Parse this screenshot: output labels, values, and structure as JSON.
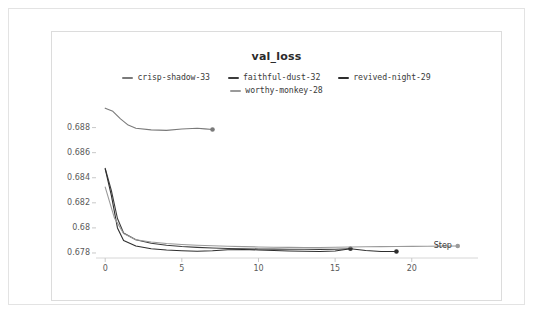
{
  "panel": {
    "background": "#ffffff",
    "border_color": "#e3e3e3"
  },
  "chart_data": {
    "type": "line",
    "title": "val_loss",
    "xlabel": "Step",
    "ylabel": "",
    "xlim": [
      -0.6,
      23.8
    ],
    "ylim": [
      0.6776,
      0.6902
    ],
    "xticks": [
      0,
      5,
      10,
      15,
      20
    ],
    "xtick_labels": [
      "0",
      "5",
      "10",
      "15",
      "20"
    ],
    "yticks": [
      0.678,
      0.68,
      0.682,
      0.684,
      0.686,
      0.688
    ],
    "ytick_labels": [
      "0.678",
      "0.68",
      "0.682",
      "0.684",
      "0.686",
      "0.688"
    ],
    "grid": false,
    "legend_position": "top-center",
    "end_marker": "dot",
    "series": [
      {
        "name": "crisp-shadow-33",
        "color": "#7a7a7a",
        "x": [
          0,
          0.5,
          1,
          1.5,
          2,
          3,
          4,
          5,
          6,
          6.5,
          7
        ],
        "y": [
          0.68955,
          0.6893,
          0.6887,
          0.6882,
          0.68795,
          0.68782,
          0.68778,
          0.68789,
          0.68795,
          0.6879,
          0.68785
        ]
      },
      {
        "name": "faithful-dust-32",
        "color": "#3c3c3c",
        "x": [
          0,
          0.4,
          0.8,
          1.2,
          2,
          3,
          4,
          5,
          6,
          7,
          8,
          9,
          10,
          11,
          12,
          13,
          14,
          15,
          16
        ],
        "y": [
          0.68475,
          0.683,
          0.68075,
          0.6796,
          0.67905,
          0.67878,
          0.67862,
          0.67852,
          0.67845,
          0.6784,
          0.67836,
          0.67834,
          0.67832,
          0.67831,
          0.6783,
          0.6783,
          0.67829,
          0.6783,
          0.67834
        ]
      },
      {
        "name": "revived-night-29",
        "color": "#2e2e2e",
        "x": [
          0,
          0.4,
          0.8,
          1.2,
          2,
          3,
          4,
          5,
          6,
          7,
          8,
          9,
          10,
          11,
          12,
          13,
          14,
          15,
          16,
          17,
          18,
          19
        ],
        "y": [
          0.6847,
          0.6826,
          0.68,
          0.679,
          0.67856,
          0.67834,
          0.67824,
          0.67818,
          0.67814,
          0.67818,
          0.67826,
          0.67828,
          0.67824,
          0.6782,
          0.67816,
          0.67814,
          0.67812,
          0.67816,
          0.67834,
          0.6782,
          0.67812,
          0.67812
        ]
      },
      {
        "name": "worthy-monkey-28",
        "color": "#9a9a9a",
        "x": [
          0,
          0.6,
          1.2,
          2,
          3,
          4,
          5,
          6,
          7,
          8,
          9,
          10,
          11,
          12,
          13,
          14,
          15,
          16,
          17,
          18,
          19,
          20,
          21,
          22,
          23
        ],
        "y": [
          0.68325,
          0.6808,
          0.67955,
          0.67905,
          0.67888,
          0.67876,
          0.67868,
          0.67862,
          0.67858,
          0.67854,
          0.67851,
          0.67848,
          0.67846,
          0.67845,
          0.67844,
          0.67844,
          0.67846,
          0.67848,
          0.6785,
          0.67851,
          0.67852,
          0.67853,
          0.67854,
          0.67855,
          0.67856
        ]
      }
    ]
  }
}
